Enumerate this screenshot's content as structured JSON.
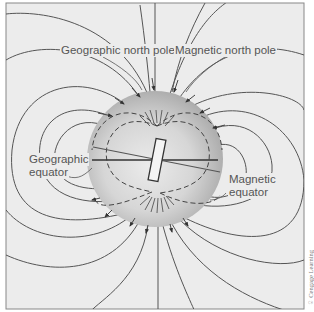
{
  "figure": {
    "labels": {
      "geographic_north_pole": "Geographic north pole",
      "magnetic_north_pole": "Magnetic north pole",
      "geographic_equator_line1": "Geographic",
      "geographic_equator_line2": "equator",
      "magnetic_equator_line1": "Magnetic",
      "magnetic_equator_line2": "equator"
    },
    "credit": "© Cengage Learning",
    "colors": {
      "background": "#ececec",
      "frame": "#888888",
      "field_line": "#555555",
      "globe_light": "#e6e6e6",
      "globe_dark": "#a8a8a8",
      "label_text": "#555555"
    },
    "elements": {
      "globe": {
        "cx": 155,
        "cy": 159,
        "r": 68
      },
      "geographic_axis": "vertical",
      "magnetic_axis_tilt_deg": 11
    }
  }
}
